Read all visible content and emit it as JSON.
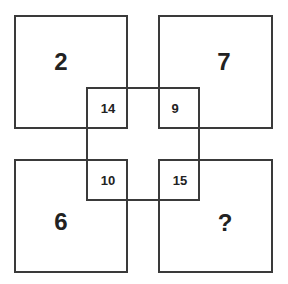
{
  "puzzle": {
    "corner_squares": [
      {
        "position": "top-left",
        "value": "2"
      },
      {
        "position": "top-right",
        "value": "7"
      },
      {
        "position": "bottom-left",
        "value": "6"
      },
      {
        "position": "bottom-right",
        "value": "?"
      }
    ],
    "overlap_cells": [
      {
        "position": "top-left",
        "value": "14"
      },
      {
        "position": "top-right",
        "value": "9"
      },
      {
        "position": "bottom-left",
        "value": "10"
      },
      {
        "position": "bottom-right",
        "value": "15"
      }
    ]
  },
  "colors": {
    "line": "#3a3a3a",
    "text": "#222222",
    "background": "#ffffff"
  }
}
